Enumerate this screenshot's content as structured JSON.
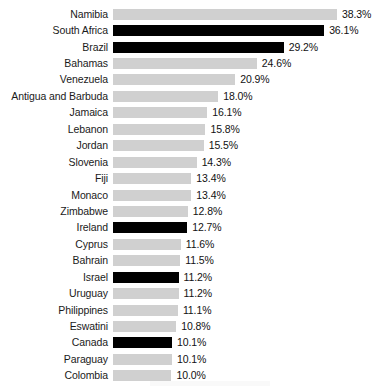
{
  "chart_data": {
    "type": "bar",
    "orientation": "horizontal",
    "title": "",
    "subtitle": "",
    "xlabel": "",
    "ylabel": "",
    "grid": false,
    "legend": false,
    "value_suffix": "%",
    "xlim": [
      0,
      38.3
    ],
    "categories": [
      "Namibia",
      "South Africa",
      "Brazil",
      "Bahamas",
      "Venezuela",
      "Antigua and Barbuda",
      "Jamaica",
      "Lebanon",
      "Jordan",
      "Slovenia",
      "Fiji",
      "Monaco",
      "Zimbabwe",
      "Ireland",
      "Cyprus",
      "Bahrain",
      "Israel",
      "Uruguay",
      "Philippines",
      "Eswatini",
      "Canada",
      "Paraguay",
      "Colombia"
    ],
    "values": [
      38.3,
      36.1,
      29.2,
      24.6,
      20.9,
      18.0,
      16.1,
      15.8,
      15.5,
      14.3,
      13.4,
      13.4,
      12.8,
      12.7,
      11.6,
      11.5,
      11.2,
      11.2,
      11.1,
      10.8,
      10.1,
      10.1,
      10.0
    ],
    "value_labels": [
      "38.3%",
      "36.1%",
      "29.2%",
      "24.6%",
      "20.9%",
      "18.0%",
      "16.1%",
      "15.8%",
      "15.5%",
      "14.3%",
      "13.4%",
      "13.4%",
      "12.8%",
      "12.7%",
      "11.6%",
      "11.5%",
      "11.2%",
      "11.2%",
      "11.1%",
      "10.8%",
      "10.1%",
      "10.1%",
      "10.0%"
    ],
    "highlighted": [
      false,
      true,
      true,
      false,
      false,
      false,
      false,
      false,
      false,
      false,
      false,
      false,
      false,
      true,
      false,
      false,
      true,
      false,
      false,
      false,
      true,
      false,
      false
    ],
    "colors": {
      "bar_default": "#d0d0d0",
      "bar_highlight": "#000000",
      "label_text": "#1a1a1a",
      "value_text": "#111111",
      "background": "#ffffff"
    }
  }
}
